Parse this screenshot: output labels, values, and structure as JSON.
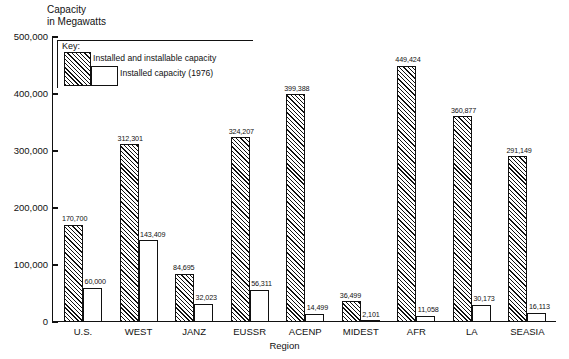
{
  "chart_data": {
    "type": "bar",
    "title": "",
    "ylabel": "Capacity\nin Megawatts",
    "xlabel": "Region",
    "ylim": [
      0,
      500000
    ],
    "yticks": [
      0,
      100000,
      200000,
      300000,
      400000,
      500000
    ],
    "ytick_labels": [
      "0",
      "100,000",
      "200,000",
      "300,000",
      "400,000",
      "500,000"
    ],
    "grid": false,
    "legend_position": "inside-top-left",
    "legend_title": "Key:",
    "categories": [
      "U.S.",
      "WEST",
      "JANZ",
      "EUSSR",
      "ACENP",
      "MIDEST",
      "AFR",
      "LA",
      "SEASIA"
    ],
    "series": [
      {
        "name": "Installed and installable capacity",
        "style": "hatched",
        "values": [
          170700,
          312301,
          84695,
          324207,
          399388,
          36499,
          449424,
          360877,
          291149
        ],
        "value_labels": [
          "170,700",
          "312,301",
          "84,695",
          "324,207",
          "399,388",
          "36,499",
          "449,424",
          "360,877",
          "291,149"
        ]
      },
      {
        "name": "Installed capacity (1976)",
        "style": "open",
        "values": [
          60000,
          143409,
          32023,
          56311,
          14499,
          2101,
          11058,
          30173,
          16113
        ],
        "value_labels": [
          "60,000",
          "143,409",
          "32,023",
          "56,311",
          "14,499",
          "2,101",
          "11,058",
          "30,173",
          "16,113"
        ]
      }
    ]
  }
}
